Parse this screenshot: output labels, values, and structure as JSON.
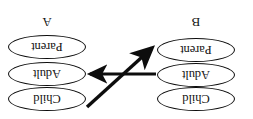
{
  "figure": {
    "orientation": "rotated-180",
    "background_color": "#ffffff",
    "stroke_color": "#0d0d0d",
    "text_color": "#111111"
  },
  "groups": [
    {
      "id": "group-a",
      "label": "A",
      "side": "right",
      "nodes": [
        {
          "label": "Parent"
        },
        {
          "label": "Adult"
        },
        {
          "label": "Child"
        }
      ]
    },
    {
      "id": "group-b",
      "label": "B",
      "side": "left",
      "nodes": [
        {
          "label": "Parent"
        },
        {
          "label": "Adult"
        },
        {
          "label": "Child"
        }
      ]
    }
  ],
  "arrows": [
    {
      "id": "arrow-horizontal",
      "from": "group-b-adult",
      "to": "group-a-adult",
      "direction": "right"
    },
    {
      "id": "arrow-diagonal",
      "from": "group-a-child",
      "to": "group-b-parent",
      "direction": "down-left"
    }
  ]
}
